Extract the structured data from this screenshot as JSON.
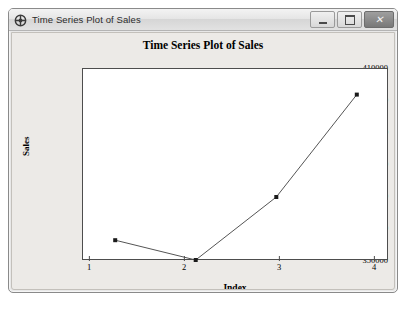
{
  "window": {
    "title": "Time Series Plot of Sales",
    "icon": "minitab-window-icon",
    "buttons": {
      "minimize": "minimize-button",
      "maximize": "maximize-button",
      "close_glyph": "✕"
    }
  },
  "caption": "",
  "chart_data": {
    "type": "line",
    "title": "Time Series Plot of Sales",
    "xlabel": "Index",
    "ylabel": "Sales",
    "x": [
      1,
      2,
      3,
      4
    ],
    "values": [
      356500,
      350300,
      370000,
      402000
    ],
    "xticks": [
      "1",
      "2",
      "3",
      "4"
    ],
    "yticks": [
      "350000",
      "360000",
      "370000",
      "380000",
      "390000",
      "400000",
      "410000"
    ],
    "xlim": [
      0.6,
      4.4
    ],
    "ylim": [
      350000,
      410000
    ],
    "grid": false,
    "legend": "none",
    "marker": "filled-square",
    "line_color": "#555555",
    "marker_color": "#1a1a1a",
    "plot_bg": "#ffffff",
    "panel_bg": "#eceae7"
  }
}
